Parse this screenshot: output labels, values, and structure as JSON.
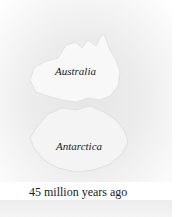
{
  "map": {
    "labels": {
      "australia": "Australia",
      "antarctica": "Antarctica"
    },
    "colors": {
      "land": "#f7f7f7",
      "ocean": "#e8e8e8",
      "text": "#1a1a1a"
    }
  },
  "caption": "45 million years ago"
}
